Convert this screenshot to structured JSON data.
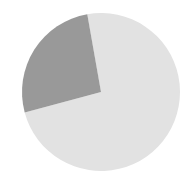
{
  "figure": {
    "background_color": "#ffffff",
    "width": 194,
    "height": 185
  },
  "chart_data": {
    "type": "pie",
    "title": "",
    "subtitle": "",
    "xlabel": "",
    "ylabel": "",
    "grid": false,
    "legend": false,
    "legend_position": "none",
    "labels": [
      "",
      ""
    ],
    "values": [
      74,
      26
    ],
    "percentages": [
      "74%",
      "26%"
    ],
    "colors": [
      "#e2e2e2",
      "#999999"
    ],
    "annotations": [],
    "geometry": {
      "center_x": 101,
      "center_y": 92,
      "radius": 79,
      "start_angle_deg": 100,
      "direction": "counterclockwise"
    },
    "slices": [
      {
        "name": "slice-light",
        "label": "",
        "value": 74,
        "percent": "74%",
        "color": "#e2e2e2",
        "start_angle_deg": 195,
        "end_angle_deg": 460,
        "sweep_deg": 265
      },
      {
        "name": "slice-dark",
        "label": "",
        "value": 26,
        "percent": "26%",
        "color": "#999999",
        "start_angle_deg": 100,
        "end_angle_deg": 195,
        "sweep_deg": 95
      }
    ]
  }
}
